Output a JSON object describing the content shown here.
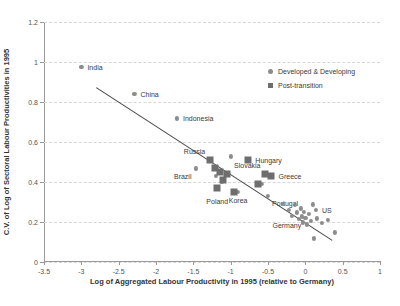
{
  "chart_data": {
    "type": "scatter",
    "title": "",
    "xlabel": "Log of Aggregated Labour Productivity in 1995 (relative to Germany)",
    "ylabel": "C.V. of Log of Sectoral Labour Productivities in 1995",
    "xlim": [
      -3.5,
      1
    ],
    "ylim": [
      0,
      1.2
    ],
    "xticks": [
      "-3.5",
      "-3",
      "-2.5",
      "-2",
      "-1.5",
      "-1",
      "-0.5",
      "0",
      "0.5",
      "1"
    ],
    "xtick_values": [
      -3.5,
      -3,
      -2.5,
      -2,
      -1.5,
      -1,
      -0.5,
      0,
      0.5,
      1
    ],
    "yticks": [
      "0",
      "0.2",
      "0.4",
      "0.6",
      "0.8",
      "1",
      "1.2"
    ],
    "ytick_values": [
      0,
      0.2,
      0.4,
      0.6,
      0.8,
      1.0,
      1.2
    ],
    "grid": "horizontal-dashed",
    "legend_position": "upper-right-inside",
    "legend": [
      {
        "name": "Developed & Developing",
        "marker": "circle",
        "color": "#8c8c8c"
      },
      {
        "name": "Post-transition",
        "marker": "square",
        "color": "#6e6e6e"
      }
    ],
    "trendline": {
      "x": [
        -2.8,
        0.36
      ],
      "y": [
        0.872,
        0.108
      ],
      "color": "#4a4a4a"
    },
    "series": [
      {
        "name": "Developed & Developing",
        "marker": "circle",
        "color": "#8c8c8c",
        "points": [
          {
            "x": -3.0,
            "y": 0.975,
            "label": "India",
            "label_pos": "right"
          },
          {
            "x": -2.29,
            "y": 0.842,
            "label": "China",
            "label_pos": "right"
          },
          {
            "x": -1.72,
            "y": 0.718,
            "label": "Indonesia",
            "label_pos": "right"
          },
          {
            "x": -1.47,
            "y": 0.468,
            "label": "Brazil",
            "label_pos": "below-left"
          },
          {
            "x": -1.0,
            "y": 0.528,
            "label": "",
            "label_pos": ""
          },
          {
            "x": -1.2,
            "y": 0.432,
            "label": "",
            "label_pos": ""
          },
          {
            "x": -1.12,
            "y": 0.4,
            "label": "",
            "label_pos": ""
          },
          {
            "x": -0.9,
            "y": 0.352,
            "label": "Korea",
            "label_pos": "below"
          },
          {
            "x": -0.58,
            "y": 0.392,
            "label": "",
            "label_pos": ""
          },
          {
            "x": -0.5,
            "y": 0.33,
            "label": "Portugal",
            "label_pos": "below-right"
          },
          {
            "x": -0.3,
            "y": 0.292,
            "label": "",
            "label_pos": ""
          },
          {
            "x": -0.22,
            "y": 0.262,
            "label": "",
            "label_pos": ""
          },
          {
            "x": -0.18,
            "y": 0.232,
            "label": "",
            "label_pos": ""
          },
          {
            "x": -0.14,
            "y": 0.285,
            "label": "",
            "label_pos": ""
          },
          {
            "x": -0.11,
            "y": 0.248,
            "label": "",
            "label_pos": ""
          },
          {
            "x": -0.09,
            "y": 0.215,
            "label": "",
            "label_pos": ""
          },
          {
            "x": -0.06,
            "y": 0.268,
            "label": "",
            "label_pos": ""
          },
          {
            "x": -0.05,
            "y": 0.228,
            "label": "",
            "label_pos": ""
          },
          {
            "x": -0.03,
            "y": 0.198,
            "label": "",
            "label_pos": ""
          },
          {
            "x": -0.02,
            "y": 0.252,
            "label": "",
            "label_pos": ""
          },
          {
            "x": 0.0,
            "y": 0.222,
            "label": "Germany",
            "label_pos": "below-left"
          },
          {
            "x": 0.02,
            "y": 0.188,
            "label": "",
            "label_pos": ""
          },
          {
            "x": 0.05,
            "y": 0.24,
            "label": "",
            "label_pos": ""
          },
          {
            "x": 0.07,
            "y": 0.205,
            "label": "",
            "label_pos": ""
          },
          {
            "x": 0.1,
            "y": 0.288,
            "label": "",
            "label_pos": ""
          },
          {
            "x": 0.14,
            "y": 0.262,
            "label": "US",
            "label_pos": "right"
          },
          {
            "x": 0.16,
            "y": 0.218,
            "label": "",
            "label_pos": ""
          },
          {
            "x": 0.22,
            "y": 0.196,
            "label": "",
            "label_pos": ""
          },
          {
            "x": 0.3,
            "y": 0.21,
            "label": "",
            "label_pos": ""
          },
          {
            "x": 0.12,
            "y": 0.118,
            "label": "",
            "label_pos": ""
          },
          {
            "x": 0.4,
            "y": 0.148,
            "label": "",
            "label_pos": ""
          }
        ]
      },
      {
        "name": "Post-transition",
        "marker": "square",
        "color": "#6e6e6e",
        "points": [
          {
            "x": -1.28,
            "y": 0.512,
            "label": "Russia",
            "label_pos": "above-left"
          },
          {
            "x": -1.21,
            "y": 0.472,
            "label": "",
            "label_pos": ""
          },
          {
            "x": -1.14,
            "y": 0.448,
            "label": "",
            "label_pos": ""
          },
          {
            "x": -1.05,
            "y": 0.438,
            "label": "",
            "label_pos": ""
          },
          {
            "x": -1.1,
            "y": 0.408,
            "label": "",
            "label_pos": ""
          },
          {
            "x": -1.18,
            "y": 0.372,
            "label": "",
            "label_pos": ""
          },
          {
            "x": -0.96,
            "y": 0.348,
            "label": "Poland",
            "label_pos": "below-left"
          },
          {
            "x": -0.77,
            "y": 0.51,
            "label": "Hungary",
            "label_pos": "right"
          },
          {
            "x": -0.54,
            "y": 0.442,
            "label": "Slovakia",
            "label_pos": "above-left"
          },
          {
            "x": -0.46,
            "y": 0.432,
            "label": "Greece",
            "label_pos": "right"
          },
          {
            "x": -0.64,
            "y": 0.388,
            "label": "",
            "label_pos": ""
          }
        ]
      }
    ]
  }
}
